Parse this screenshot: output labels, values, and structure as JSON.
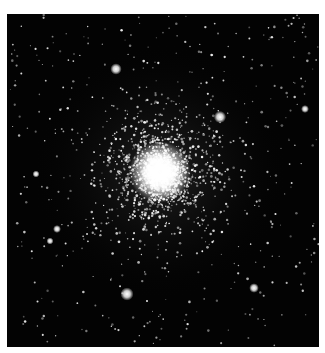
{
  "image": {
    "subject": "Globular star cluster",
    "background_color": "#030303",
    "border_color": "#ffffff",
    "core": {
      "x": 153,
      "y": 158,
      "radius": 14
    },
    "bright_stars": [
      {
        "x": 109,
        "y": 55,
        "r": 2.6
      },
      {
        "x": 213,
        "y": 103,
        "r": 2.8
      },
      {
        "x": 120,
        "y": 280,
        "r": 3.0
      },
      {
        "x": 247,
        "y": 274,
        "r": 2.2
      },
      {
        "x": 298,
        "y": 95,
        "r": 1.8
      },
      {
        "x": 50,
        "y": 215,
        "r": 1.8
      },
      {
        "x": 29,
        "y": 160,
        "r": 1.6
      },
      {
        "x": 43,
        "y": 227,
        "r": 1.6
      }
    ]
  }
}
